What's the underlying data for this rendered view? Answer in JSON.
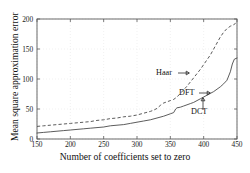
{
  "chart_data": {
    "type": "line",
    "title": "",
    "xlabel": "Number of coefficients set to zero",
    "ylabel": "Mean square approximation error",
    "xlim": [
      150,
      450
    ],
    "ylim": [
      0,
      200
    ],
    "xticks": [
      150,
      200,
      250,
      300,
      350,
      400,
      450
    ],
    "yticks": [
      0,
      50,
      100,
      150,
      200
    ],
    "grid": true,
    "legend_position": "inline-annotations",
    "series": [
      {
        "name": "Haar",
        "style": "dashed",
        "x": [
          150,
          160,
          170,
          180,
          190,
          200,
          210,
          220,
          230,
          240,
          250,
          260,
          270,
          280,
          290,
          300,
          310,
          320,
          325,
          330,
          335,
          340,
          345,
          350,
          355,
          360,
          365,
          370,
          375,
          380,
          385,
          390,
          395,
          400,
          405,
          410,
          415,
          420,
          425,
          430,
          435,
          440,
          445,
          450
        ],
        "values": [
          21,
          22,
          23,
          24,
          25,
          26,
          27,
          28,
          29,
          31,
          32,
          34,
          35,
          37,
          38,
          40,
          43,
          46,
          48,
          51,
          56,
          60,
          62,
          64,
          66,
          70,
          76,
          82,
          88,
          95,
          102,
          109,
          116,
          124,
          132,
          140,
          150,
          160,
          170,
          178,
          184,
          188,
          190,
          196
        ]
      },
      {
        "name": "DFT",
        "style": "solid",
        "x": [
          150,
          160,
          170,
          180,
          190,
          200,
          210,
          220,
          230,
          240,
          250,
          260,
          270,
          280,
          290,
          300,
          310,
          320,
          330,
          340,
          350,
          355,
          358,
          360,
          365,
          370,
          375,
          380,
          385,
          390,
          395,
          400,
          405,
          410,
          415,
          420,
          425,
          430,
          435,
          440,
          443,
          446,
          450
        ],
        "values": [
          10,
          11,
          12,
          13,
          14,
          15,
          16,
          17,
          18,
          19,
          20,
          22,
          23,
          24,
          26,
          28,
          30,
          32,
          35,
          38,
          42,
          44,
          50,
          52,
          53,
          55,
          57,
          59,
          61,
          64,
          67,
          70,
          73,
          76,
          79,
          83,
          87,
          92,
          98,
          112,
          125,
          133,
          135
        ]
      },
      {
        "name": "DCT",
        "style": "solid",
        "x": [
          150,
          450
        ],
        "values": [
          10,
          135
        ]
      }
    ],
    "annotations": [
      {
        "text": "Haar",
        "arrow": "right"
      },
      {
        "text": "DFT",
        "arrow": "right"
      },
      {
        "text": "DCT",
        "arrow": "up"
      }
    ]
  },
  "axes": {
    "x_title": "Number of coefficients set to zero",
    "y_title": "Mean square approximation error",
    "x_tick_labels": [
      "150",
      "200",
      "250",
      "300",
      "350",
      "400",
      "450"
    ],
    "y_tick_labels": [
      "0",
      "50",
      "100",
      "150",
      "200"
    ]
  },
  "annotations": {
    "haar_label": "Haar",
    "dft_label": "DFT",
    "dct_label": "DCT"
  },
  "colors": {
    "curve": "#4a4a4a",
    "axis": "#5a5a5a",
    "grid": "#e8e8e8",
    "text": "#111111",
    "background": "#ffffff"
  }
}
